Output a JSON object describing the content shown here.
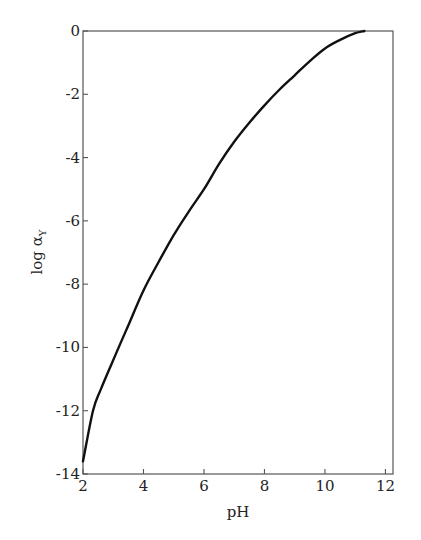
{
  "chart_data": {
    "type": "line",
    "title": "",
    "xlabel": "pH",
    "ylabel": "log α",
    "ylabel_subscript": "Y",
    "xlim": [
      2,
      12.25
    ],
    "ylim": [
      -14,
      0
    ],
    "grid": false,
    "legend": null,
    "x_ticks": [
      2,
      4,
      6,
      8,
      10,
      12
    ],
    "x_tick_labels": [
      "2",
      "4",
      "6",
      "8",
      "10",
      "12"
    ],
    "y_ticks": [
      0,
      -2,
      -4,
      -6,
      -8,
      -10,
      -12,
      -14
    ],
    "y_tick_labels": [
      "0",
      "-2",
      "-4",
      "-6",
      "-8",
      "-10",
      "-12",
      "-14"
    ],
    "series": [
      {
        "name": "log αY vs pH",
        "color": "#111111",
        "x": [
          2.0,
          2.33,
          2.6,
          3.18,
          3.5,
          4.0,
          4.5,
          5.0,
          5.5,
          6.0,
          6.5,
          7.0,
          7.5,
          8.0,
          8.5,
          9.0,
          9.5,
          10.0,
          10.5,
          11.0,
          11.3
        ],
        "y": [
          -13.6,
          -12.0,
          -11.3,
          -10.0,
          -9.3,
          -8.2,
          -7.3,
          -6.45,
          -5.7,
          -5.0,
          -4.2,
          -3.5,
          -2.9,
          -2.35,
          -1.85,
          -1.4,
          -0.95,
          -0.55,
          -0.28,
          -0.07,
          0.0
        ]
      }
    ]
  }
}
